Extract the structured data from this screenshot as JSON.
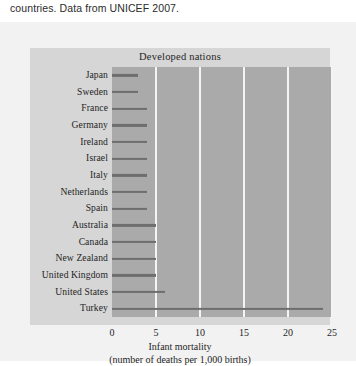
{
  "caption": {
    "text": "countries. Data from UNICEF 2007."
  },
  "chart_data": {
    "type": "bar",
    "orientation": "horizontal",
    "title": "Developed nations",
    "xlabel": "Infant mortality",
    "xlabel_sub": "(number of deaths per 1,000 births)",
    "ylabel": "",
    "xlim": [
      0,
      25
    ],
    "xticks": [
      0,
      5,
      10,
      15,
      20,
      25
    ],
    "xticklabels": [
      "0",
      "5",
      "10",
      "15",
      "20",
      "25"
    ],
    "grid": "vertical",
    "legend": "none",
    "categories": [
      "Japan",
      "Sweden",
      "France",
      "Germany",
      "Ireland",
      "Israel",
      "Italy",
      "Netherlands",
      "Spain",
      "Australia",
      "Canada",
      "New Zealand",
      "United Kingdom",
      "United States",
      "Turkey"
    ],
    "values": [
      3,
      3,
      4,
      4,
      4,
      4,
      4,
      4,
      4,
      5,
      5,
      5,
      5,
      6,
      24
    ],
    "bar_color": "#6e6e6e",
    "plot_bg_color": "#aaaaaa",
    "panel_bg_color": "#d6d6d6",
    "gridline_color": "#f4f4f4",
    "figure_bg_color": "#f2f2f2"
  }
}
